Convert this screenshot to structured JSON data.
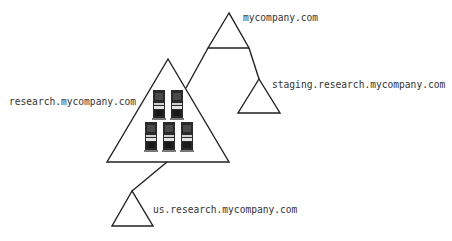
{
  "diagram": {
    "colors": {
      "line": "#222222",
      "label": "#333333",
      "server_body": "#2a2a2a",
      "server_panel": "#d8d8d8",
      "server_base": "#777777"
    },
    "nodes": [
      {
        "id": "root",
        "label": "mycompany.com",
        "icon": "triangle-domain-icon"
      },
      {
        "id": "research",
        "label": "research.mycompany.com",
        "icon": "triangle-domain-icon",
        "contains": "server-cluster-icon",
        "server_count": 5
      },
      {
        "id": "staging",
        "label": "staging.research.mycompany.com",
        "icon": "triangle-domain-icon"
      },
      {
        "id": "us",
        "label": "us.research.mycompany.com",
        "icon": "triangle-domain-icon"
      }
    ],
    "edges": [
      {
        "from": "root",
        "to": "research"
      },
      {
        "from": "root",
        "to": "staging"
      },
      {
        "from": "research",
        "to": "us"
      }
    ]
  }
}
